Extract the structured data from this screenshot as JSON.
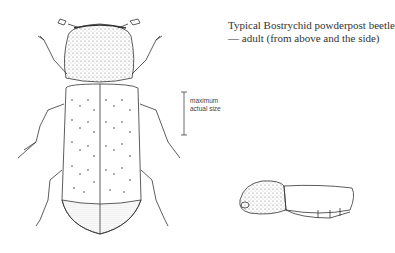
{
  "caption": {
    "line1": "Typical Bostrychid powderpost beetle",
    "line2": "— adult (from above and the side)"
  },
  "scale_bar": {
    "line1": "maximum",
    "line2": "actual size"
  },
  "figures": [
    {
      "name": "beetle-dorsal-view",
      "description": "top view"
    },
    {
      "name": "beetle-lateral-view",
      "description": "side view"
    }
  ],
  "colors": {
    "ink": "#333333",
    "background": "#ffffff"
  }
}
